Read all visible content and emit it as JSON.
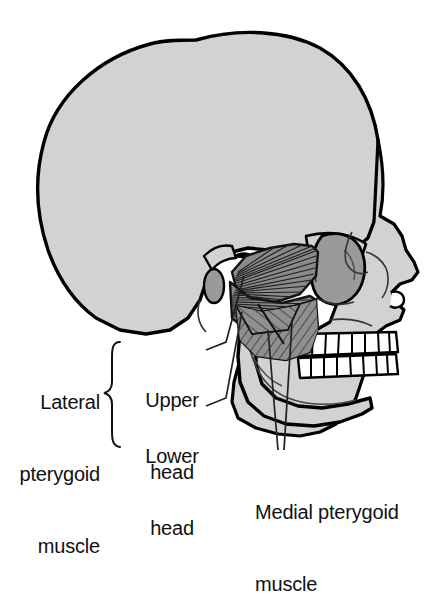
{
  "figure": {
    "type": "anatomical-illustration",
    "width": 438,
    "height": 522,
    "background_color": "#ffffff"
  },
  "colors": {
    "bone": "#d2d2d2",
    "bone_outline": "#000000",
    "tooth": "#ffffff",
    "orbit": "#9a9a9a",
    "lateral_pterygoid_muscle": "#8a8a8a",
    "medial_pterygoid_muscle": "#8f8f8f",
    "muscle_striation": "#1a1a1a",
    "leader_line": "#222222",
    "text": "#111111"
  },
  "labels": {
    "lateral_pterygoid": "Lateral\npterygoid\nmuscle",
    "lateral_pterygoid_line1": "Lateral",
    "lateral_pterygoid_line2": "pterygoid",
    "lateral_pterygoid_line3": "muscle",
    "upper_head": "Upper\nhead",
    "upper_head_line1": "Upper",
    "upper_head_line2": "head",
    "lower_head": "Lower\nhead",
    "lower_head_line1": "Lower",
    "lower_head_line2": "head",
    "medial_pterygoid": "Medial pterygoid\nmuscle",
    "medial_pterygoid_line1": "Medial pterygoid",
    "medial_pterygoid_line2": "muscle"
  },
  "structures": [
    {
      "name": "cranium",
      "fill": "#d2d2d2"
    },
    {
      "name": "orbit",
      "fill": "#9a9a9a"
    },
    {
      "name": "zygomatic-arch",
      "fill": "#d2d2d2"
    },
    {
      "name": "maxilla",
      "fill": "#d2d2d2"
    },
    {
      "name": "mandible",
      "fill": "#d2d2d2"
    },
    {
      "name": "upper-teeth",
      "fill": "#ffffff",
      "count": 8
    },
    {
      "name": "lower-teeth",
      "fill": "#ffffff",
      "count": 8
    },
    {
      "name": "lateral-pterygoid-upper-head",
      "fill": "#8a8a8a"
    },
    {
      "name": "lateral-pterygoid-lower-head",
      "fill": "#8a8a8a"
    },
    {
      "name": "medial-pterygoid",
      "fill": "#8f8f8f"
    },
    {
      "name": "mandibular-condyle",
      "fill": "#d2d2d2"
    },
    {
      "name": "coronoid-process",
      "fill": "#d2d2d2"
    },
    {
      "name": "external-acoustic-meatus",
      "fill": "#9a9a9a"
    }
  ],
  "brace": {
    "name": "lateral-pterygoid-brace",
    "glyph": "{"
  }
}
